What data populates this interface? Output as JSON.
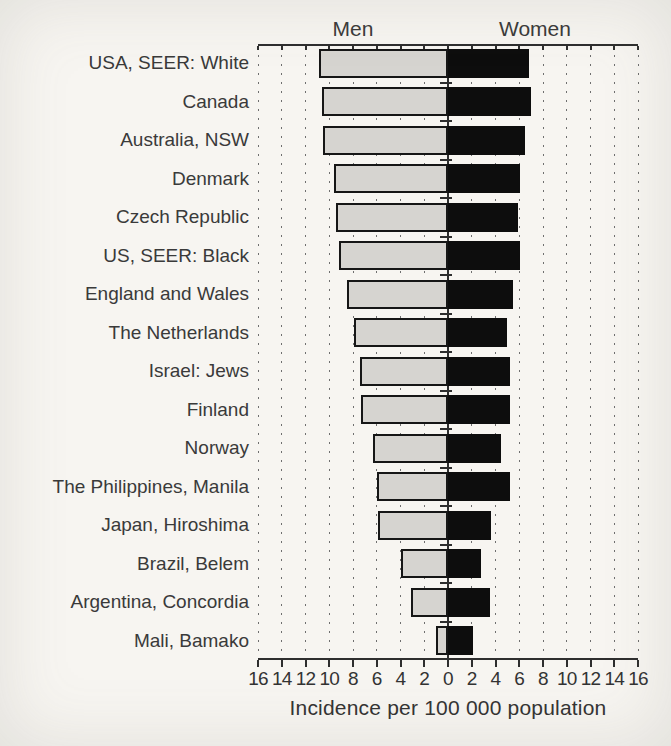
{
  "chart_data": {
    "type": "bar",
    "variant": "bidirectional-horizontal",
    "title": "",
    "left_header": "Men",
    "right_header": "Women",
    "xlabel": "Incidence per 100 000 population",
    "axis": {
      "min": 0,
      "max": 16,
      "tick_step": 2,
      "tick_labels": [
        "16",
        "14",
        "12",
        "10",
        "8",
        "6",
        "4",
        "2",
        "0",
        "2",
        "4",
        "6",
        "8",
        "10",
        "12",
        "14",
        "16"
      ]
    },
    "grid": {
      "style": "dashed-vertical",
      "interval": 2
    },
    "legend_position": "none",
    "categories": [
      "USA, SEER:  White",
      "Canada",
      "Australia, NSW",
      "Denmark",
      "Czech Republic",
      "US, SEER: Black",
      "England and Wales",
      "The Netherlands",
      "Israel: Jews",
      "Finland",
      "Norway",
      "The Philippines, Manila",
      "Japan, Hiroshima",
      "Brazil, Belem",
      "Argentina, Concordia",
      "Mali, Bamako"
    ],
    "series": [
      {
        "name": "Men",
        "side": "left",
        "color": "#d6d4d0",
        "values": [
          10.9,
          10.6,
          10.5,
          9.6,
          9.4,
          9.2,
          8.5,
          7.9,
          7.4,
          7.3,
          6.3,
          6.0,
          5.9,
          4.0,
          3.1,
          1.0
        ]
      },
      {
        "name": "Women",
        "side": "right",
        "color": "#0d0d0d",
        "values": [
          6.8,
          7.0,
          6.5,
          6.1,
          5.9,
          6.1,
          5.5,
          5.0,
          5.2,
          5.2,
          4.5,
          5.2,
          3.6,
          2.8,
          3.5,
          2.1
        ]
      }
    ],
    "colors": {
      "men_bar": "#d6d4d0",
      "women_bar": "#0d0d0d",
      "bar_border": "#161616",
      "axis_line": "#2e2e2e",
      "grid_line": "#6f6f6f",
      "text": "#3a3a3a",
      "background": "#f7f5f1"
    }
  }
}
